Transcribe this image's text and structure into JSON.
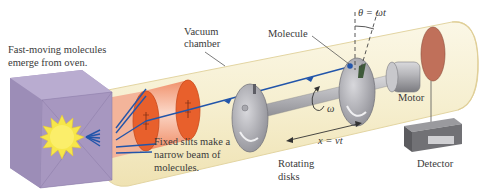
{
  "diagram": {
    "type": "apparatus-schematic",
    "labels": {
      "oven_line1": "Fast-moving molecules",
      "oven_line2": "emerge from oven.",
      "vacuum_line1": "Vacuum",
      "vacuum_line2": "chamber",
      "slits_line1": "Fixed slits make a",
      "slits_line2": "narrow beam of",
      "slits_line3": "molecules.",
      "molecule": "Molecule",
      "theta": "θ = ωt",
      "omega": "ω",
      "distance": "x = vt",
      "disks_line1": "Rotating",
      "disks_line2": "disks",
      "motor": "Motor",
      "detector": "Detector"
    },
    "components": [
      {
        "name": "oven",
        "color": "#a99ac0"
      },
      {
        "name": "heat-source",
        "color": "#f6e64a"
      },
      {
        "name": "fixed-slits",
        "count": 2,
        "color": "#e8602c"
      },
      {
        "name": "vacuum-tube",
        "color": "#f6f0d2"
      },
      {
        "name": "rotating-disks",
        "count": 2,
        "color": "#9c9ca4"
      },
      {
        "name": "motor",
        "color": "#a9a9ae"
      },
      {
        "name": "detector-plate",
        "color": "#c0705a"
      },
      {
        "name": "detector-box",
        "color": "#6e6e72"
      }
    ],
    "colors": {
      "beam": "#2255aa",
      "tube_fill": "#f7f1d6",
      "tube_edge": "#e6d9a8",
      "slit_cylinder": "#f4a88a",
      "text": "#3a3a3a"
    }
  }
}
